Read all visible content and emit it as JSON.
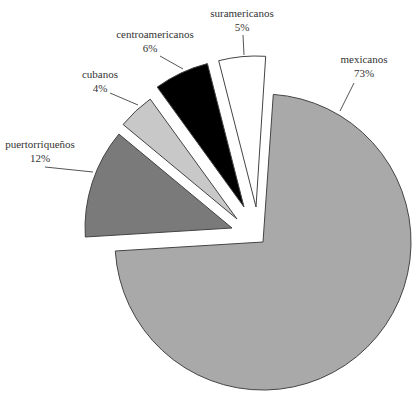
{
  "chart_data": {
    "type": "pie",
    "title": "",
    "exploded": true,
    "categories": [
      "mexicanos",
      "puertorriqueños",
      "cubanos",
      "centroamericanos",
      "suramericanos"
    ],
    "values": [
      73,
      12,
      4,
      6,
      5
    ],
    "value_labels": [
      "73%",
      "12%",
      "4%",
      "6%",
      "5%"
    ],
    "colors": [
      "#a9a9a9",
      "#7a7a7a",
      "#c8c8c8",
      "#000000",
      "#ffffff"
    ],
    "legend": "none (direct labels with leader lines)"
  },
  "slices": [
    {
      "name": "mexicanos",
      "pct": "73%",
      "color": "#a9a9a9",
      "cx": 263,
      "cy": 242,
      "r": 148,
      "a0": -86,
      "a1": 176.5,
      "label": {
        "x": 364,
        "y": 63,
        "lx1": 354,
        "ly1": 83,
        "lx2": 340,
        "ly2": 111
      }
    },
    {
      "name": "puertorriqueños",
      "pct": "12%",
      "color": "#7a7a7a",
      "cx": 232,
      "cy": 228,
      "r": 147,
      "a0": 176.5,
      "a1": 219.7,
      "label": {
        "x": 40,
        "y": 148,
        "lx1": 45,
        "ly1": 167,
        "lx2": 93,
        "ly2": 172
      }
    },
    {
      "name": "cubanos",
      "pct": "4%",
      "color": "#c8c8c8",
      "cx": 237,
      "cy": 219,
      "r": 148,
      "a0": 219.7,
      "a1": 234.1,
      "label": {
        "x": 100,
        "y": 78,
        "lx1": 110,
        "ly1": 93,
        "lx2": 138,
        "ly2": 105
      }
    },
    {
      "name": "centroamericanos",
      "pct": "6%",
      "color": "#000000",
      "cx": 244,
      "cy": 207,
      "r": 148,
      "a0": 234.1,
      "a1": 255.7,
      "label": {
        "x": 155,
        "y": 38,
        "lx1": 160,
        "ly1": 56,
        "lx2": 183,
        "ly2": 69
      }
    },
    {
      "name": "suramericanos",
      "pct": "5%",
      "color": "#ffffff",
      "cx": 256,
      "cy": 207,
      "r": 151,
      "a0": 255.7,
      "a1": 273.7,
      "label": {
        "x": 242,
        "y": 17,
        "lx1": 243,
        "ly1": 35,
        "lx2": 244,
        "ly2": 55
      }
    }
  ],
  "labels": {
    "mexicanos": {
      "name": "mexicanos",
      "pct": "73%"
    },
    "puertorriquenos": {
      "name": "puertorriqueños",
      "pct": "12%"
    },
    "cubanos": {
      "name": "cubanos",
      "pct": "4%"
    },
    "centroamericanos": {
      "name": "centroamericanos",
      "pct": "6%"
    },
    "suramericanos": {
      "name": "suramericanos",
      "pct": "5%"
    }
  }
}
